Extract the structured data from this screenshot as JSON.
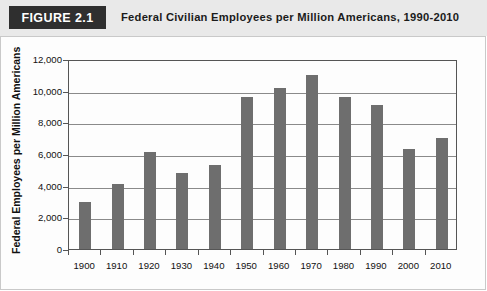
{
  "header": {
    "badge": "FIGURE 2.1",
    "title": "Federal Civilian Employees per Million Americans, 1990-2010",
    "badge_bg": "#2f2f2f",
    "band_bg": "#e9e9e9"
  },
  "chart_data": {
    "type": "bar",
    "title": "Federal Civilian Employees per Million Americans, 1990-2010",
    "xlabel": "",
    "ylabel": "Federal Employees per Million Americans",
    "categories": [
      "1900",
      "1910",
      "1920",
      "1930",
      "1940",
      "1950",
      "1960",
      "1970",
      "1980",
      "1990",
      "2000",
      "2010"
    ],
    "values": [
      3000,
      4100,
      6100,
      4800,
      5300,
      9600,
      10200,
      11000,
      9600,
      9100,
      6300,
      7000
    ],
    "ylim": [
      0,
      12000
    ],
    "ytick_step": 2000,
    "ytick_labels": [
      "0",
      "2,000",
      "4,000",
      "6,000",
      "8,000",
      "10,000",
      "12,000"
    ],
    "ytick_values": [
      0,
      2000,
      4000,
      6000,
      8000,
      10000,
      12000
    ],
    "grid": true,
    "legend": null,
    "bar_color": "#6e6e6e",
    "plot_border_color": "#555555",
    "gridline_color": "#8a8a8a"
  }
}
